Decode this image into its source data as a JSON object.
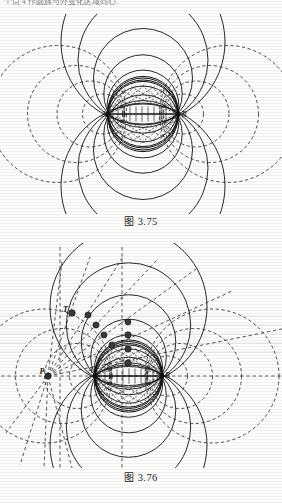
{
  "page": {
    "top_running_text": "个点 4 作圆族与外变化区域同心."
  },
  "figures": [
    {
      "id": "fig-375",
      "caption_prefix": "图",
      "caption_number": "3.75",
      "caption_full": "图 3.75",
      "description": "Apollonian / bipolar coordinate family of circles through two foci",
      "point_labels": [
        "A",
        "B"
      ],
      "solid_circle_count": 10,
      "dashed_circle_count": 10,
      "axis": "horizontal"
    },
    {
      "id": "fig-376",
      "caption_prefix": "图",
      "caption_number": "3.76",
      "caption_full": "图 3.76",
      "description": "Apollonian circles with inversion pencil of rays from P and marker chain to T",
      "point_labels": [
        "P",
        "T",
        "A",
        "B"
      ],
      "marker_count": 9,
      "ray_count": 13,
      "axis": "horizontal"
    }
  ],
  "colors": {
    "ink": "#1a1a1a",
    "paper": "#fdfdfc",
    "dashed": "#2b2b2b",
    "band": "#dcdcdc",
    "marker": "#3a3a3a"
  }
}
